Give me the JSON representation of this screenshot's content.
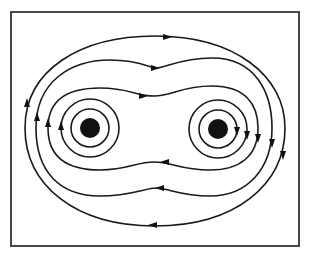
{
  "diagram": {
    "title": "",
    "colors": {
      "line": "#1a1a1a",
      "frame": "#333333",
      "wire": "#111111",
      "background": "#ffffff"
    },
    "frame": {
      "x": 11,
      "y": 12,
      "width": 288,
      "height": 234
    },
    "wires": [
      {
        "id": "left-wire",
        "cx": 90,
        "cy": 128,
        "r": 10
      },
      {
        "id": "right-wire",
        "cx": 218,
        "cy": 129,
        "r": 10
      }
    ],
    "rings": [
      {
        "wire": "left-wire",
        "r": 19
      },
      {
        "wire": "left-wire",
        "r": 29
      },
      {
        "wire": "right-wire",
        "r": 19
      },
      {
        "wire": "right-wire",
        "r": 29
      }
    ],
    "field_direction": "clockwise",
    "enclosing_loops": 3
  }
}
